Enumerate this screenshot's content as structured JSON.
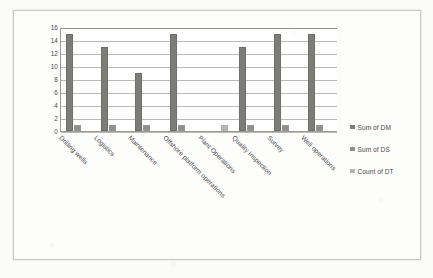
{
  "chart_data": {
    "type": "bar",
    "title": "",
    "subtitle": "",
    "xlabel": "",
    "ylabel": "",
    "ylim": [
      0,
      16
    ],
    "yticks": [
      16,
      14,
      12,
      10,
      8,
      6,
      4,
      2,
      0
    ],
    "grid": true,
    "legend_position": "right",
    "categories": [
      "Drilling wells",
      "Logistics",
      "Maintenance",
      "Offshore platform operations",
      "Plant Operations",
      "Quality inspection",
      "Survey",
      "Well operations"
    ],
    "series": [
      {
        "name": "Sum of DM",
        "color": "#7c7c79",
        "values": [
          15,
          13,
          9,
          15,
          0,
          13,
          15,
          15
        ]
      },
      {
        "name": "Sum of DS",
        "color": "#8f8f8c",
        "values": [
          1,
          1,
          1,
          1,
          0,
          1,
          1,
          1
        ]
      },
      {
        "name": "Count of DT",
        "color": "#b4b4b1",
        "values": [
          0,
          0,
          0,
          0,
          1,
          0,
          0,
          0
        ]
      }
    ]
  },
  "legend": {
    "items": [
      {
        "label": "Sum of DM"
      },
      {
        "label": "Sum of DS"
      },
      {
        "label": "Count of DT"
      }
    ]
  },
  "colors": {
    "series_dm": "#7c7c79",
    "series_ds": "#8f8f8c",
    "series_dt": "#b4b4b1",
    "gridline": "#b9b9b6",
    "axis": "#9a9a97",
    "frame_border": "#c9c9c6",
    "text": "#4a4a48",
    "plot_background": "#ffffff",
    "page_background": "#fbfbfa"
  }
}
